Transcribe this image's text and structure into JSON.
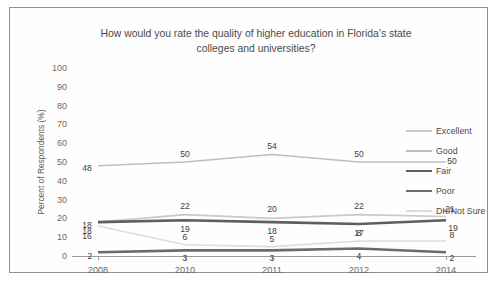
{
  "chart_data": {
    "type": "line",
    "title": "How would you rate the quality of higher education in Florida's state colleges and universities?",
    "title_line1": "How would you rate the quality of higher education in Florida's state",
    "title_line2": "colleges and universities?",
    "xlabel": "",
    "ylabel": "Percent of Respondents (%)",
    "categories": [
      "2008",
      "2010",
      "2011",
      "2012",
      "2014"
    ],
    "yticks": [
      100,
      90,
      80,
      70,
      60,
      50,
      40,
      30,
      20,
      10,
      0
    ],
    "ylim": [
      0,
      100
    ],
    "grid": false,
    "legend_position": "right",
    "series": [
      {
        "name": "Excellent",
        "values": [
          18,
          22,
          20,
          22,
          21
        ],
        "color": "#c9c9c9",
        "width": 1.6
      },
      {
        "name": "Good",
        "values": [
          48,
          50,
          54,
          50,
          50
        ],
        "color": "#bdbdbd",
        "width": 1.6
      },
      {
        "name": "Fair",
        "values": [
          18,
          19,
          18,
          17,
          19
        ],
        "color": "#5e5e5e",
        "width": 2.6
      },
      {
        "name": "Poor",
        "values": [
          2,
          3,
          3,
          4,
          2
        ],
        "color": "#6b6b6b",
        "width": 2.6
      },
      {
        "name": "DK/Not Sure",
        "values": [
          16,
          6,
          5,
          8,
          8
        ],
        "color": "#dcdcdc",
        "width": 1.6
      }
    ],
    "data_labels": {
      "Excellent": [
        "18",
        "22",
        "20",
        "22",
        "21"
      ],
      "Good": [
        "48",
        "50",
        "54",
        "50",
        "50"
      ],
      "Fair": [
        "18",
        "19",
        "18",
        "17",
        "19"
      ],
      "Poor": [
        "2",
        "3",
        "3",
        "4",
        "2"
      ],
      "DK/Not Sure": [
        "16",
        "6",
        "5",
        "8",
        "8"
      ]
    }
  }
}
